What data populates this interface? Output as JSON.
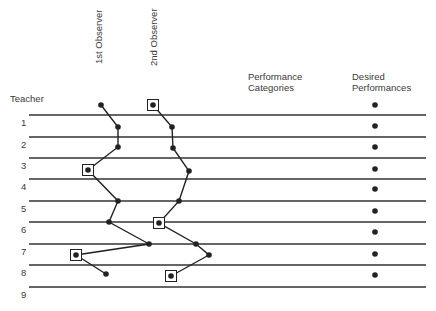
{
  "labels": {
    "teacher": "Teacher",
    "observer1": "1st Observer",
    "observer2": "2nd Observer",
    "performance_line1": "Performance",
    "performance_line2": "Categories",
    "desired_line1": "Desired",
    "desired_line2": "Performances"
  },
  "rows": [
    "1",
    "2",
    "3",
    "4",
    "5",
    "6",
    "7",
    "8",
    "9"
  ],
  "row_lines_y": [
    115,
    137,
    158,
    179,
    201,
    222,
    244,
    265,
    287
  ],
  "observer1_points": [
    {
      "x": 101,
      "y": 105,
      "boxed": false
    },
    {
      "x": 118,
      "y": 127,
      "boxed": false
    },
    {
      "x": 118,
      "y": 147,
      "boxed": false
    },
    {
      "x": 88,
      "y": 170,
      "boxed": true
    },
    {
      "x": 118,
      "y": 201,
      "boxed": false
    },
    {
      "x": 109,
      "y": 222,
      "boxed": false
    },
    {
      "x": 149,
      "y": 244,
      "boxed": false
    },
    {
      "x": 76,
      "y": 255,
      "boxed": true
    },
    {
      "x": 106,
      "y": 274,
      "boxed": false
    }
  ],
  "observer2_points": [
    {
      "x": 153,
      "y": 105,
      "boxed": true
    },
    {
      "x": 172,
      "y": 127,
      "boxed": false
    },
    {
      "x": 173,
      "y": 148,
      "boxed": false
    },
    {
      "x": 189,
      "y": 171,
      "boxed": false
    },
    {
      "x": 179,
      "y": 201,
      "boxed": false
    },
    {
      "x": 159,
      "y": 223,
      "boxed": true
    },
    {
      "x": 196,
      "y": 244,
      "boxed": false
    },
    {
      "x": 209,
      "y": 255,
      "boxed": false
    },
    {
      "x": 171,
      "y": 276,
      "boxed": true
    }
  ],
  "desired_points_x": 375,
  "desired_points_y": [
    105,
    126,
    147,
    169,
    189,
    211,
    232,
    254,
    275
  ],
  "colors": {
    "ink": "#222222",
    "line": "#333333"
  }
}
